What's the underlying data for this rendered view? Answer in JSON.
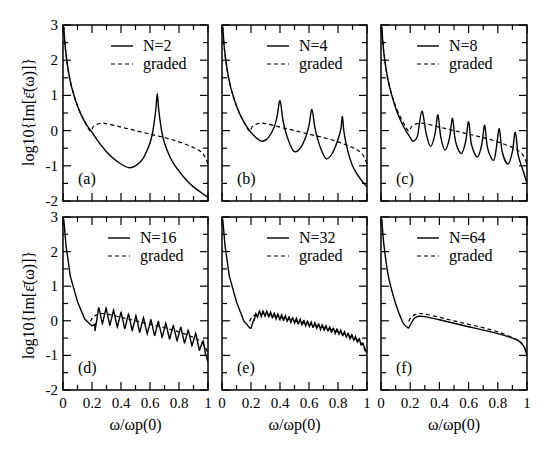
{
  "figure": {
    "ylabel": "log10{Im[ε̄(ω)]}",
    "xlabel": "ω/ωp(0)",
    "xticks": [
      "0",
      "0.2",
      "0.4",
      "0.6",
      "0.8",
      "1"
    ],
    "yticks": [
      "-2",
      "-1",
      "0",
      "1",
      "2",
      "3"
    ]
  },
  "chart_data": [
    {
      "type": "line",
      "panel": "(a)",
      "legend": [
        "N=2",
        "graded"
      ],
      "xlabel": "ω/ω_p(0)",
      "ylabel": "log10{Im[ε̄(ω)]}",
      "xlim": [
        0,
        1
      ],
      "ylim": [
        -2,
        3
      ],
      "series": [
        {
          "name": "N=2",
          "style": "solid",
          "x": [
            0.005,
            0.02,
            0.05,
            0.1,
            0.15,
            0.2,
            0.25,
            0.3,
            0.35,
            0.4,
            0.45,
            0.5,
            0.55,
            0.6,
            0.62,
            0.64,
            0.65,
            0.66,
            0.68,
            0.7,
            0.75,
            0.8,
            0.85,
            0.9,
            0.95,
            1.0
          ],
          "y": [
            2.95,
            2.2,
            1.4,
            0.7,
            0.25,
            -0.05,
            -0.35,
            -0.6,
            -0.8,
            -0.95,
            -1.05,
            -1.0,
            -0.8,
            -0.35,
            0.0,
            0.6,
            1.05,
            0.6,
            0.0,
            -0.35,
            -0.85,
            -1.15,
            -1.4,
            -1.6,
            -1.75,
            -1.9
          ]
        },
        {
          "name": "graded",
          "style": "dashed",
          "x": [
            0.005,
            0.02,
            0.05,
            0.1,
            0.15,
            0.19,
            0.21,
            0.25,
            0.3,
            0.4,
            0.5,
            0.6,
            0.7,
            0.8,
            0.9,
            0.95,
            0.98,
            1.0
          ],
          "y": [
            2.95,
            2.2,
            1.4,
            0.7,
            0.25,
            -0.02,
            0.12,
            0.2,
            0.2,
            0.1,
            0.0,
            -0.1,
            -0.2,
            -0.32,
            -0.48,
            -0.6,
            -0.75,
            -0.95
          ]
        }
      ]
    },
    {
      "type": "line",
      "panel": "(b)",
      "legend": [
        "N=4",
        "graded"
      ],
      "xlabel": "ω/ω_p(0)",
      "ylabel": "log10{Im[ε̄(ω)]}",
      "xlim": [
        0,
        1
      ],
      "ylim": [
        -2,
        3
      ],
      "series": [
        {
          "name": "N=4",
          "style": "solid",
          "x": [
            0.005,
            0.02,
            0.05,
            0.1,
            0.15,
            0.2,
            0.25,
            0.28,
            0.32,
            0.36,
            0.38,
            0.4,
            0.42,
            0.44,
            0.47,
            0.5,
            0.54,
            0.58,
            0.6,
            0.62,
            0.64,
            0.66,
            0.69,
            0.72,
            0.76,
            0.8,
            0.82,
            0.83,
            0.84,
            0.86,
            0.9,
            0.95,
            1.0
          ],
          "y": [
            2.95,
            2.2,
            1.4,
            0.7,
            0.25,
            -0.05,
            -0.25,
            -0.3,
            -0.2,
            0.1,
            0.4,
            0.85,
            0.3,
            -0.05,
            -0.4,
            -0.6,
            -0.5,
            -0.15,
            0.15,
            0.6,
            0.1,
            -0.25,
            -0.6,
            -0.8,
            -0.65,
            -0.25,
            0.05,
            0.4,
            0.0,
            -0.45,
            -1.0,
            -1.35,
            -1.6
          ]
        },
        {
          "name": "graded",
          "style": "dashed",
          "x": [
            0.005,
            0.02,
            0.05,
            0.1,
            0.15,
            0.19,
            0.21,
            0.25,
            0.3,
            0.4,
            0.5,
            0.6,
            0.7,
            0.8,
            0.9,
            0.95,
            0.98,
            1.0
          ],
          "y": [
            2.95,
            2.2,
            1.4,
            0.7,
            0.25,
            -0.02,
            0.12,
            0.2,
            0.2,
            0.1,
            0.0,
            -0.1,
            -0.2,
            -0.32,
            -0.48,
            -0.6,
            -0.75,
            -0.95
          ]
        }
      ]
    },
    {
      "type": "line",
      "panel": "(c)",
      "legend": [
        "N=8",
        "graded"
      ],
      "xlabel": "ω/ω_p(0)",
      "ylabel": "log10{Im[ε̄(ω)]}",
      "xlim": [
        0,
        1
      ],
      "ylim": [
        -2,
        3
      ],
      "series": [
        {
          "name": "N=8",
          "style": "solid",
          "x": [
            0.005,
            0.02,
            0.05,
            0.1,
            0.15,
            0.2,
            0.22,
            0.25,
            0.28,
            0.31,
            0.34,
            0.37,
            0.39,
            0.41,
            0.44,
            0.47,
            0.49,
            0.51,
            0.55,
            0.58,
            0.6,
            0.62,
            0.66,
            0.69,
            0.71,
            0.73,
            0.77,
            0.79,
            0.81,
            0.83,
            0.87,
            0.9,
            0.92,
            0.94,
            0.97,
            1.0
          ],
          "y": [
            2.95,
            2.2,
            1.4,
            0.65,
            0.15,
            -0.2,
            -0.3,
            -0.15,
            0.55,
            -0.1,
            -0.45,
            -0.1,
            0.45,
            -0.2,
            -0.55,
            -0.2,
            0.35,
            -0.3,
            -0.65,
            -0.3,
            0.25,
            -0.4,
            -0.75,
            -0.4,
            0.15,
            -0.5,
            -0.85,
            -0.5,
            0.05,
            -0.6,
            -0.95,
            -0.6,
            -0.05,
            -0.7,
            -1.1,
            -1.5
          ]
        },
        {
          "name": "graded",
          "style": "dashed",
          "x": [
            0.005,
            0.02,
            0.05,
            0.1,
            0.15,
            0.19,
            0.21,
            0.25,
            0.3,
            0.4,
            0.5,
            0.6,
            0.7,
            0.8,
            0.9,
            0.95,
            0.98,
            1.0
          ],
          "y": [
            2.95,
            2.2,
            1.4,
            0.7,
            0.25,
            -0.02,
            0.12,
            0.2,
            0.2,
            0.1,
            0.0,
            -0.1,
            -0.2,
            -0.32,
            -0.48,
            -0.6,
            -0.75,
            -0.95
          ]
        }
      ]
    },
    {
      "type": "line",
      "panel": "(d)",
      "legend": [
        "N=16",
        "graded"
      ],
      "xlabel": "ω/ω_p(0)",
      "ylabel": "log10{Im[ε̄(ω)]}",
      "xlim": [
        0,
        1
      ],
      "ylim": [
        -2,
        3
      ],
      "oscillation": {
        "start": 0.22,
        "period": 0.0515,
        "amp_start": 0.35,
        "amp_end": 0.3
      },
      "series": [
        {
          "name": "N=16",
          "style": "solid",
          "x": [
            0.005,
            0.02,
            0.05,
            0.1,
            0.15,
            0.2,
            0.22,
            0.25,
            0.3,
            0.4,
            0.5,
            0.6,
            0.7,
            0.8,
            0.9,
            0.95,
            0.98,
            1.0
          ],
          "y": [
            2.95,
            2.2,
            1.3,
            0.55,
            0.05,
            -0.15,
            -0.1,
            0.15,
            0.1,
            0.0,
            -0.1,
            -0.2,
            -0.3,
            -0.4,
            -0.55,
            -0.7,
            -0.9,
            -1.2
          ]
        },
        {
          "name": "graded",
          "style": "dashed",
          "x": [
            0.19,
            0.21,
            0.25,
            0.3,
            0.4,
            0.5,
            0.6,
            0.7,
            0.8,
            0.9,
            0.95,
            0.98,
            1.0
          ],
          "y": [
            -0.02,
            0.12,
            0.2,
            0.2,
            0.1,
            0.0,
            -0.1,
            -0.2,
            -0.32,
            -0.48,
            -0.6,
            -0.75,
            -0.95
          ]
        }
      ]
    },
    {
      "type": "line",
      "panel": "(e)",
      "legend": [
        "N=32",
        "graded"
      ],
      "xlabel": "ω/ω_p(0)",
      "ylabel": "log10{Im[ε̄(ω)]}",
      "xlim": [
        0,
        1
      ],
      "ylim": [
        -2,
        3
      ],
      "oscillation": {
        "start": 0.22,
        "period": 0.0255,
        "amp_start": 0.12,
        "amp_end": 0.1
      },
      "series": [
        {
          "name": "N=32",
          "style": "solid",
          "x": [
            0.005,
            0.02,
            0.05,
            0.1,
            0.15,
            0.19,
            0.2,
            0.22,
            0.25,
            0.3,
            0.4,
            0.5,
            0.6,
            0.7,
            0.8,
            0.9,
            0.95,
            0.98,
            1.0
          ],
          "y": [
            2.95,
            2.2,
            1.3,
            0.55,
            0.0,
            -0.2,
            -0.22,
            0.05,
            0.2,
            0.2,
            0.1,
            0.0,
            -0.1,
            -0.2,
            -0.32,
            -0.48,
            -0.6,
            -0.75,
            -0.95
          ]
        },
        {
          "name": "graded",
          "style": "dashed",
          "x": [
            0.19,
            0.21,
            0.25,
            0.3,
            0.4,
            0.5,
            0.6,
            0.7,
            0.8,
            0.9,
            0.95,
            0.98,
            1.0
          ],
          "y": [
            -0.02,
            0.12,
            0.2,
            0.2,
            0.1,
            0.0,
            -0.1,
            -0.2,
            -0.32,
            -0.48,
            -0.6,
            -0.75,
            -0.95
          ]
        }
      ]
    },
    {
      "type": "line",
      "panel": "(f)",
      "legend": [
        "N=64",
        "graded"
      ],
      "xlabel": "ω/ω_p(0)",
      "ylabel": "log10{Im[ε̄(ω)]}",
      "xlim": [
        0,
        1
      ],
      "ylim": [
        -2,
        3
      ],
      "series": [
        {
          "name": "N=64",
          "style": "solid",
          "x": [
            0.005,
            0.02,
            0.05,
            0.1,
            0.15,
            0.18,
            0.19,
            0.21,
            0.23,
            0.26,
            0.3,
            0.4,
            0.5,
            0.6,
            0.7,
            0.8,
            0.9,
            0.95,
            0.98,
            1.0
          ],
          "y": [
            2.95,
            2.2,
            1.3,
            0.5,
            -0.05,
            -0.18,
            -0.2,
            -0.05,
            0.08,
            0.13,
            0.12,
            0.03,
            -0.07,
            -0.17,
            -0.27,
            -0.37,
            -0.5,
            -0.6,
            -0.75,
            -1.0
          ]
        },
        {
          "name": "graded",
          "style": "dashed",
          "x": [
            0.19,
            0.21,
            0.25,
            0.3,
            0.4,
            0.5,
            0.6,
            0.7,
            0.8,
            0.9,
            0.95,
            0.98,
            1.0
          ],
          "y": [
            -0.02,
            0.12,
            0.2,
            0.2,
            0.1,
            0.0,
            -0.1,
            -0.2,
            -0.32,
            -0.48,
            -0.6,
            -0.75,
            -0.95
          ]
        }
      ]
    }
  ]
}
